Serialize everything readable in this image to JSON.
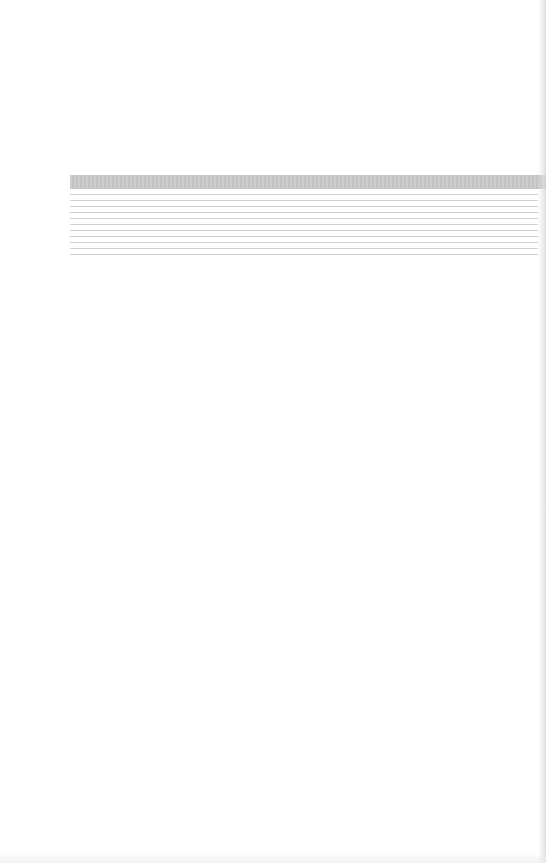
{
  "page": {
    "type": "blank ruled form page",
    "background_color": "#ffffff"
  },
  "form": {
    "header_bar": {
      "label": "",
      "color": "#c9c9c9"
    },
    "ruled_lines": [
      {
        "text": ""
      },
      {
        "text": ""
      },
      {
        "text": ""
      },
      {
        "text": ""
      },
      {
        "text": ""
      },
      {
        "text": ""
      },
      {
        "text": ""
      },
      {
        "text": ""
      },
      {
        "text": ""
      },
      {
        "text": ""
      },
      {
        "text": ""
      }
    ],
    "line_color": "#cfcfcf"
  }
}
